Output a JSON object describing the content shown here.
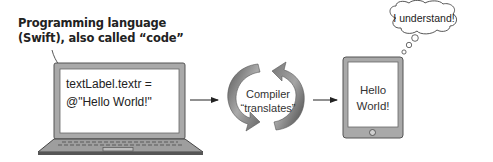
{
  "callout": {
    "line1": "Programming language",
    "line2": "(Swift), also called “code”"
  },
  "laptop": {
    "code_line1": "textLabel.textr =",
    "code_line2": "@\"Hello World!\""
  },
  "compiler": {
    "line1": "Compiler",
    "line2": "“translates”"
  },
  "tablet": {
    "line1": "Hello",
    "line2": "World!"
  },
  "thought_bubble": {
    "text": "I understand!"
  },
  "colors": {
    "device_frame": "#a8a8a8",
    "device_border": "#555555",
    "cycle_arrow_light": "#b5b5b5",
    "cycle_arrow_dark": "#6e6e6e",
    "text": "#222222"
  }
}
